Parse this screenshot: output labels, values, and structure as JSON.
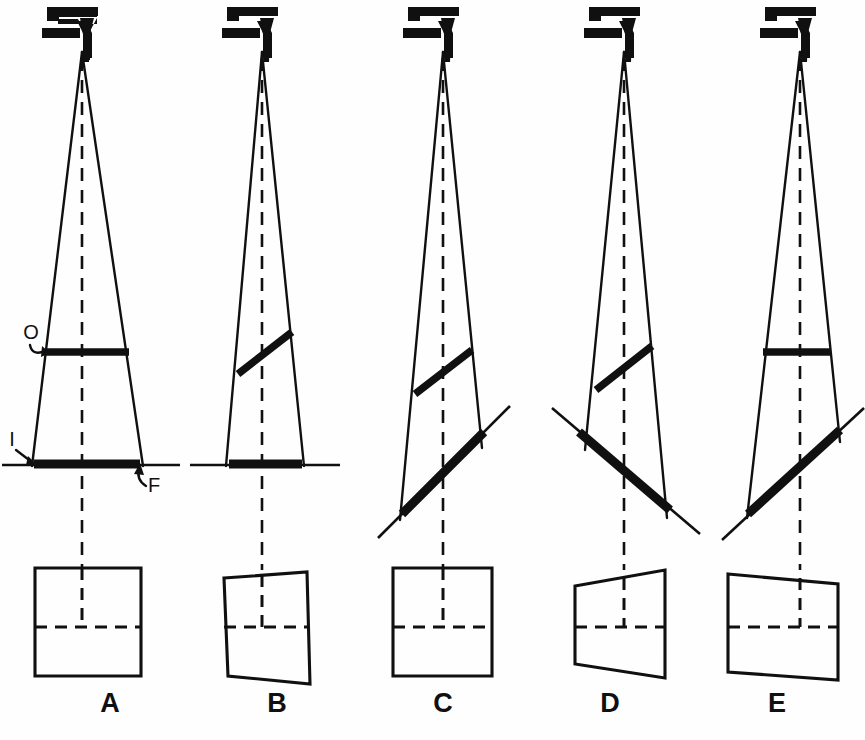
{
  "figure": {
    "background_color": "#fefefe",
    "ink_color": "#101010",
    "width": 865,
    "height": 740
  },
  "annotations": {
    "object_label": "O",
    "image_label": "I",
    "film_label": "F",
    "object_meaning": "object",
    "image_meaning": "image",
    "film_meaning": "film"
  },
  "panels": [
    {
      "id": "A",
      "letter": "A",
      "letter_x": 110,
      "letter_y": 712,
      "source": {
        "x": 82,
        "y": 40
      },
      "beam": {
        "left_x": 32,
        "right_x": 143,
        "bottom_y": 466
      },
      "object": {
        "x1": 45,
        "y1": 352,
        "x2": 129,
        "y2": 352,
        "tilted": false
      },
      "film": {
        "x1": 38,
        "y1": 465,
        "x2": 137,
        "y2": 465,
        "ext_x1": 2,
        "ext_x2": 180,
        "tilted": false
      },
      "central_ray": {
        "x1": 82,
        "y1": 52,
        "x2": 82,
        "y2": 570
      },
      "image_shape": {
        "points": "35,568 141,568 141,676 35,676",
        "hdash": "35,627 141,627",
        "vdash": "82,568 82,627"
      }
    },
    {
      "id": "B",
      "letter": "B",
      "letter_x": 277,
      "letter_y": 712,
      "source": {
        "x": 262,
        "y": 40
      },
      "beam": {
        "left_x": 226,
        "right_x": 304,
        "bottom_y": 466
      },
      "object": {
        "x1": 240,
        "y1": 372,
        "x2": 290,
        "y2": 333,
        "tilted": true
      },
      "film": {
        "x1": 232,
        "y1": 465,
        "x2": 299,
        "y2": 465,
        "ext_x1": 190,
        "ext_x2": 340,
        "tilted": false
      },
      "central_ray": {
        "x1": 262,
        "y1": 52,
        "x2": 262,
        "y2": 570
      },
      "image_shape": {
        "points": "224,578 307,572 310,684 228,676",
        "hdash": "224,627 309,627",
        "vdash": "262,575 262,627"
      }
    },
    {
      "id": "C",
      "letter": "C",
      "letter_x": 443,
      "letter_y": 712,
      "source": {
        "x": 443,
        "y": 40
      },
      "beam": {
        "left_x": 400,
        "right_x": 483,
        "bottom_y": 520
      },
      "object": {
        "x1": 417,
        "y1": 392,
        "x2": 470,
        "y2": 352,
        "tilted": true
      },
      "film": {
        "x1": 404,
        "y1": 512,
        "x2": 478,
        "y2": 438,
        "ext_x1": 378,
        "ext_x2": 506,
        "tilted": true
      },
      "central_ray": {
        "x1": 443,
        "y1": 52,
        "x2": 443,
        "y2": 570
      },
      "image_shape": {
        "points": "393,568 492,568 492,676 393,676",
        "hdash": "393,627 492,627",
        "vdash": "443,568 443,627"
      }
    },
    {
      "id": "D",
      "letter": "D",
      "letter_x": 610,
      "letter_y": 712,
      "source": {
        "x": 624,
        "y": 40
      },
      "beam": {
        "left_x": 585,
        "right_x": 663,
        "bottom_y": 518
      },
      "object": {
        "x1": 598,
        "y1": 388,
        "x2": 650,
        "y2": 348,
        "tilted": true
      },
      "film": {
        "x1": 578,
        "y1": 440,
        "x2": 665,
        "y2": 512,
        "ext_x1": 548,
        "ext_x2": 694,
        "tilted": true
      },
      "central_ray": {
        "x1": 624,
        "y1": 52,
        "x2": 624,
        "y2": 570
      },
      "image_shape": {
        "points": "575,586 665,570 665,678 575,664",
        "hdash": "575,627 665,627",
        "vdash": "624,578 624,627"
      }
    },
    {
      "id": "E",
      "letter": "E",
      "letter_x": 777,
      "letter_y": 712,
      "source": {
        "x": 800,
        "y": 40
      },
      "beam": {
        "left_x": 747,
        "right_x": 838,
        "bottom_y": 518
      },
      "object": {
        "x1": 765,
        "y1": 352,
        "x2": 828,
        "y2": 352,
        "tilted": false
      },
      "film": {
        "x1": 749,
        "y1": 512,
        "x2": 837,
        "y2": 434,
        "ext_x1": 722,
        "ext_x2": 862,
        "tilted": true
      },
      "central_ray": {
        "x1": 800,
        "y1": 52,
        "x2": 800,
        "y2": 570
      },
      "image_shape": {
        "points": "728,574 838,584 838,680 728,672",
        "hdash": "728,627 838,627",
        "vdash": "800,578 800,627"
      }
    }
  ]
}
